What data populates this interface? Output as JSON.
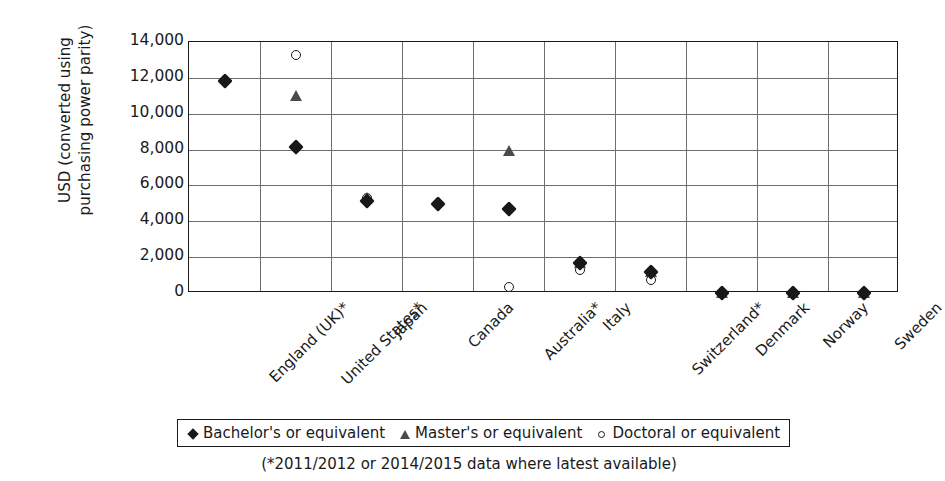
{
  "chart_data": {
    "type": "scatter",
    "title": "",
    "xlabel": "",
    "ylabel": "USD (converted using\npurchasing power parity)",
    "ylim": [
      0,
      14000
    ],
    "ytick_labels": [
      "14,000",
      "12,000",
      "10,000",
      "8,000",
      "6,000",
      "4,000",
      "2,000",
      "0"
    ],
    "ytick_values": [
      14000,
      12000,
      10000,
      8000,
      6000,
      4000,
      2000,
      0
    ],
    "grid": true,
    "legend_position": "bottom",
    "categories": [
      "England (UK)*",
      "United States*",
      "Japan",
      "Canada",
      "Australia*",
      "Italy",
      "Switzerland*",
      "Denmark",
      "Norway",
      "Sweden"
    ],
    "series": [
      {
        "name": "Bachelor's or equivalent",
        "marker": "diamond",
        "color": "#181818",
        "values": [
          11800,
          8150,
          5150,
          4950,
          4700,
          1700,
          1150,
          0,
          0,
          0
        ]
      },
      {
        "name": "Master's or equivalent",
        "marker": "triangle",
        "color": "#4a4a4a",
        "values": [
          null,
          11000,
          5300,
          null,
          7900,
          1700,
          1150,
          0,
          0,
          0
        ]
      },
      {
        "name": "Doctoral or equivalent",
        "marker": "circle",
        "color": "#181818",
        "values": [
          null,
          13300,
          5300,
          null,
          350,
          1300,
          700,
          0,
          0,
          0
        ]
      }
    ],
    "annotations": [
      "(*2011/2012 or 2014/2015 data where latest available)"
    ]
  },
  "legend": {
    "items": [
      {
        "label": "Bachelor's or equivalent",
        "glyph": "diamond-marker-icon"
      },
      {
        "label": "Master's or equivalent",
        "glyph": "triangle-marker-icon"
      },
      {
        "label": "Doctoral or equivalent",
        "glyph": "circle-marker-icon"
      }
    ]
  },
  "footnote": {
    "text": "(*2011/2012 or 2014/2015 data where latest available)"
  }
}
